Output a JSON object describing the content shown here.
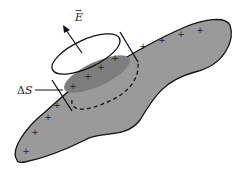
{
  "diagram": {
    "labels": {
      "field": "E",
      "field_arrow": "→",
      "area_delta": "Δ",
      "area_s": "S"
    },
    "charge_symbol": "+",
    "charges_count": 12,
    "colors": {
      "conductor_fill": "#9a9a9a",
      "inner_ellipse_fill": "#7d7d7d",
      "stroke": "#111111",
      "background": "#ffffff"
    }
  }
}
